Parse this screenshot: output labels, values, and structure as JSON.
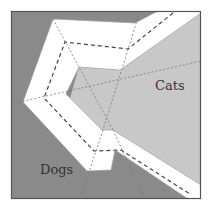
{
  "diagram": {
    "labels": {
      "dogs": "Dogs",
      "cats": "Cats"
    },
    "colors": {
      "dogs_region": "#8a8a8a",
      "cats_region": "#c8c8c8",
      "margin_band": "#ffffff",
      "frame": "#555555",
      "center_line": "#444444",
      "guide_line": "#777777"
    },
    "legend_meaning": {
      "dark_region": "Dogs",
      "light_region": "Cats",
      "white_band": "margin between classes",
      "dashed_line": "decision boundary",
      "dotted_lines": "auxiliary guide lines"
    }
  }
}
